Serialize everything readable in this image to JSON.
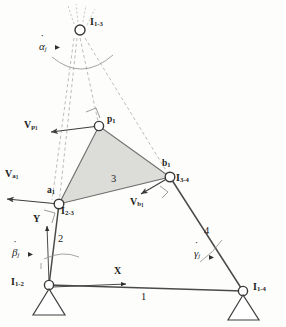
{
  "figure": {
    "background_color": "#fdfdfc",
    "coupler_fill_color": "#d9d9d6",
    "line_color": "#4a4a4a",
    "dashed_ray_color": "#b4b4b2"
  },
  "instant_centers": [
    {
      "id": "I13",
      "label": "I",
      "sub": "1-3",
      "x": 80,
      "y": 30,
      "label_x": 90,
      "label_y": 22
    },
    {
      "id": "I23",
      "label": "I",
      "sub": "2-3",
      "x": 59,
      "y": 204,
      "label_x": 61,
      "label_y": 208
    },
    {
      "id": "I34",
      "label": "I",
      "sub": "3-4",
      "x": 170,
      "y": 177,
      "label_x": 175,
      "label_y": 176
    },
    {
      "id": "I12",
      "label": "I",
      "sub": "1-2",
      "x": 49,
      "y": 285,
      "label_x": 12,
      "label_y": 279
    },
    {
      "id": "I14",
      "label": "I",
      "sub": "1-4",
      "x": 243,
      "y": 291,
      "label_x": 252,
      "label_y": 284
    }
  ],
  "points": [
    {
      "id": "p1",
      "label": "p",
      "sub": "1",
      "x": 99,
      "y": 126,
      "label_x": 106,
      "label_y": 118
    },
    {
      "id": "a1",
      "label": "a",
      "sub": "1",
      "x": 59,
      "y": 204,
      "label_x": 47,
      "label_y": 190
    },
    {
      "id": "b1",
      "label": "b",
      "sub": "1",
      "x": 170,
      "y": 177,
      "label_x": 163,
      "label_y": 163
    }
  ],
  "velocity_vectors": [
    {
      "id": "Vp1",
      "label": "V",
      "sub": "p",
      "subsub": "1",
      "from_x": 99,
      "from_y": 126,
      "to_x": 49,
      "to_y": 132,
      "label_x": 25,
      "label_y": 125
    },
    {
      "id": "Va1",
      "label": "V",
      "sub": "a",
      "subsub": "1",
      "from_x": 59,
      "from_y": 204,
      "to_x": 5,
      "to_y": 199,
      "label_x": 6,
      "label_y": 172
    },
    {
      "id": "Vb1",
      "label": "V",
      "sub": "b",
      "subsub": "1",
      "from_x": 170,
      "from_y": 177,
      "to_x": 139,
      "to_y": 195,
      "label_x": 131,
      "label_y": 201
    }
  ],
  "angular_velocities": [
    {
      "id": "alpha",
      "symbol": "α",
      "sub": "j",
      "label_x": 40,
      "label_y": 45,
      "arc_note": "arc below I1-3"
    },
    {
      "id": "beta",
      "symbol": "β",
      "sub": "j",
      "label_x": 13,
      "label_y": 252,
      "arc_note": "arc at I1-2 on link 2"
    },
    {
      "id": "gamma",
      "symbol": "γ",
      "sub": "j",
      "label_x": 196,
      "label_y": 252,
      "arc_note": "arc at link 4"
    }
  ],
  "link_labels": [
    {
      "id": "link1",
      "text": "1",
      "x": 142,
      "y": 297,
      "note": "ground link"
    },
    {
      "id": "link2",
      "text": "2",
      "x": 59,
      "y": 240,
      "note": "input crank"
    },
    {
      "id": "link3",
      "text": "3",
      "x": 113,
      "y": 180,
      "note": "coupler triangle"
    },
    {
      "id": "link4",
      "text": "4",
      "x": 205,
      "y": 232,
      "note": "output rocker"
    }
  ],
  "axes": [
    {
      "id": "x-axis",
      "text": "X",
      "label_x": 115,
      "label_y": 271,
      "from_x": 52,
      "from_y": 287,
      "to_x": 128,
      "to_y": 284
    },
    {
      "id": "y-axis",
      "text": "Y",
      "label_x": 34,
      "label_y": 219,
      "from_x": 49,
      "from_y": 282,
      "to_x": 47,
      "to_y": 224
    }
  ],
  "coupler_triangle": {
    "vertices": [
      [
        99,
        126
      ],
      [
        59,
        204
      ],
      [
        170,
        177
      ]
    ],
    "label": "3"
  },
  "links": [
    {
      "id": "ground-link",
      "from": [
        49,
        285
      ],
      "to": [
        243,
        291
      ],
      "label": "1"
    },
    {
      "id": "crank-link",
      "from": [
        49,
        285
      ],
      "to": [
        59,
        204
      ],
      "label": "2"
    },
    {
      "id": "rocker-link",
      "from": [
        170,
        177
      ],
      "to": [
        243,
        291
      ],
      "label": "4"
    }
  ],
  "ground_pivots": [
    {
      "id": "pivot-left",
      "x": 49,
      "y": 285
    },
    {
      "id": "pivot-right",
      "x": 243,
      "y": 291
    }
  ]
}
